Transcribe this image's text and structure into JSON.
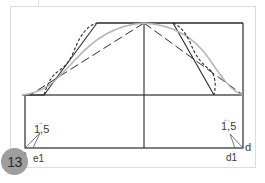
{
  "step": {
    "number": "13"
  },
  "labels": {
    "left_measure": "1,5",
    "left_arrow": "→",
    "right_measure": "1,5",
    "right_arrow": "←",
    "point_e": "e",
    "point_e1": "e1",
    "point_d": "d",
    "point_d1": "d1"
  },
  "colors": {
    "line": "#2a2a2a",
    "curve_gray": "#b5b5b5",
    "frame": "#dcdcdc",
    "badge": "#9e9e9e"
  }
}
